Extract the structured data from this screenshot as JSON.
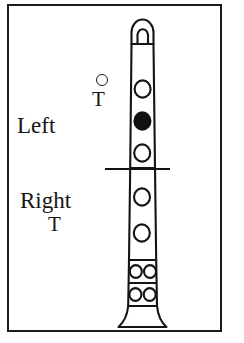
{
  "diagram": {
    "frame": {
      "border_color": "#1a1a1a"
    },
    "labels": {
      "left_hand": "Left",
      "left_hand_thumb": "T",
      "right_hand": "Right",
      "right_hand_thumb": "T"
    },
    "thumb_indicator": {
      "name": "left-thumb-hole",
      "state": "open"
    },
    "hand_divider": {
      "description": "line separating left-hand and right-hand sections"
    },
    "instrument": {
      "type": "clarinet",
      "parts": [
        "mouthpiece",
        "upper-joint",
        "lower-joint",
        "key-section",
        "bell"
      ],
      "colors": {
        "outline": "#141414",
        "hole_open_fill": "#ffffff",
        "hole_closed_fill": "#111111"
      },
      "holes": [
        {
          "index": 1,
          "section": "upper-joint",
          "hand": "left",
          "state": "open"
        },
        {
          "index": 2,
          "section": "upper-joint",
          "hand": "left",
          "state": "closed"
        },
        {
          "index": 3,
          "section": "upper-joint",
          "hand": "left",
          "state": "open"
        },
        {
          "index": 4,
          "section": "lower-joint",
          "hand": "right",
          "state": "open"
        },
        {
          "index": 5,
          "section": "lower-joint",
          "hand": "right",
          "state": "open"
        },
        {
          "index": 6,
          "section": "key-section",
          "hand": "right",
          "state": "open",
          "position": "upper-left"
        },
        {
          "index": 7,
          "section": "key-section",
          "hand": "right",
          "state": "open",
          "position": "upper-right"
        },
        {
          "index": 8,
          "section": "key-section",
          "hand": "right",
          "state": "open",
          "position": "lower-left"
        },
        {
          "index": 9,
          "section": "key-section",
          "hand": "right",
          "state": "open",
          "position": "lower-right"
        }
      ]
    }
  }
}
